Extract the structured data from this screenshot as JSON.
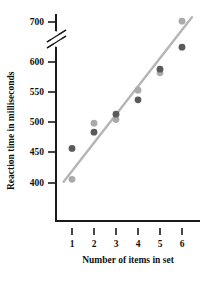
{
  "chart_data": {
    "type": "scatter",
    "title": "",
    "xlabel": "Number of items in set",
    "ylabel": "Reaction time in milliseconds",
    "x": [
      1,
      2,
      3,
      4,
      5,
      6
    ],
    "xtick_labels": [
      "1",
      "2",
      "3",
      "4",
      "5",
      "6"
    ],
    "ytick_labels": [
      "400",
      "450",
      "500",
      "550",
      "600",
      "700"
    ],
    "ytick_values": [
      400,
      450,
      500,
      550,
      600,
      700
    ],
    "ylim": [
      390,
      710
    ],
    "xlim": [
      0.5,
      6.6
    ],
    "axis_break": {
      "present": true,
      "between": [
        600,
        700
      ],
      "style": "double-slash"
    },
    "grid": false,
    "legend": null,
    "series": [
      {
        "name": "dark-points",
        "color": "#5a5a5a",
        "marker": "circle",
        "points": [
          {
            "x": 1,
            "y": 456
          },
          {
            "x": 2,
            "y": 483
          },
          {
            "x": 3,
            "y": 513
          },
          {
            "x": 4,
            "y": 537
          },
          {
            "x": 5,
            "y": 588
          },
          {
            "x": 6,
            "y": 637
          }
        ]
      },
      {
        "name": "light-points",
        "color": "#aaaaaa",
        "marker": "circle",
        "points": [
          {
            "x": 1,
            "y": 406
          },
          {
            "x": 2,
            "y": 498
          },
          {
            "x": 3,
            "y": 504
          },
          {
            "x": 4,
            "y": 553
          },
          {
            "x": 5,
            "y": 582
          },
          {
            "x": 6,
            "y": 702
          }
        ]
      }
    ],
    "trendline": {
      "name": "regression-line",
      "color": "#b5b5b5",
      "x_start": 0.62,
      "y_start": 402,
      "x_end": 6.45,
      "y_end": 712
    }
  },
  "axes": {
    "y_label": "Reaction time in milliseconds",
    "x_label": "Number of items in set",
    "axis_color": "#1a1a1a"
  },
  "icons": {
    "axis_break": "axis-break-slashes"
  }
}
